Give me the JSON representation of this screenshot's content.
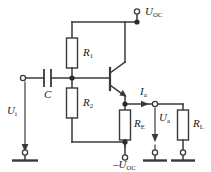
{
  "diagram": {
    "line_color": "#3a3a3a",
    "label_color": "#1a1a1a",
    "background": "#ffffff"
  },
  "labels": {
    "supply_positive": {
      "base": "U",
      "sub": "OC",
      "text": "U"
    },
    "supply_negative": {
      "prefix": "–",
      "base": "U",
      "sub": "OC"
    },
    "input_voltage": {
      "base": "U",
      "sub": "i"
    },
    "output_voltage": {
      "base": "U",
      "sub": "a"
    },
    "output_current": {
      "base": "I",
      "sub": "a"
    },
    "capacitor": {
      "base": "C",
      "sub": ""
    },
    "resistor_r1": {
      "base": "R",
      "sub": "1"
    },
    "resistor_r2": {
      "base": "R",
      "sub": "2"
    },
    "resistor_re": {
      "base": "R",
      "sub": "E"
    },
    "resistor_rl": {
      "base": "R",
      "sub": "L"
    }
  },
  "components": [
    {
      "id": "r1",
      "type": "resistor",
      "name": "R1"
    },
    {
      "id": "r2",
      "type": "resistor",
      "name": "R2"
    },
    {
      "id": "re",
      "type": "resistor",
      "name": "RE"
    },
    {
      "id": "rl",
      "type": "resistor",
      "name": "RL"
    },
    {
      "id": "c",
      "type": "capacitor",
      "name": "C"
    },
    {
      "id": "q1",
      "type": "npn-transistor",
      "name": "Q1"
    }
  ],
  "terminals": [
    {
      "id": "t-uoc",
      "name": "positive-supply-terminal"
    },
    {
      "id": "t-nuoc",
      "name": "negative-supply-terminal"
    },
    {
      "id": "t-in",
      "name": "input-terminal"
    },
    {
      "id": "t-out",
      "name": "output-terminal"
    }
  ],
  "grounds": [
    {
      "id": "gnd-input",
      "name": "input-ground"
    },
    {
      "id": "gnd-output",
      "name": "output-ground"
    },
    {
      "id": "gnd-load",
      "name": "load-ground"
    }
  ]
}
